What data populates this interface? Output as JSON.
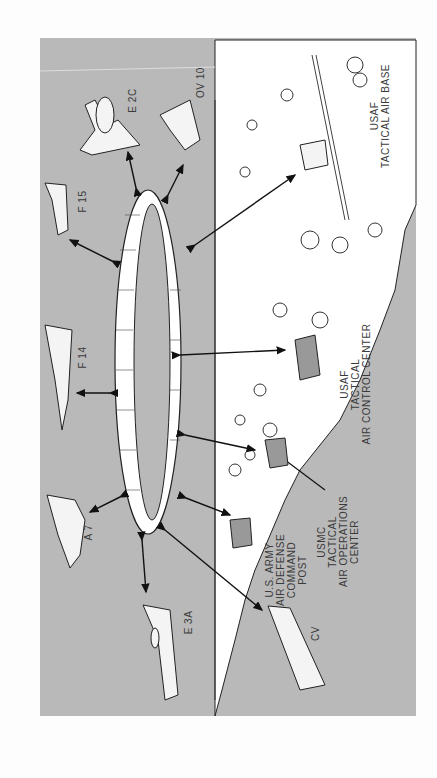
{
  "diagram": {
    "type": "communications network illustration",
    "orientation": "rotated 90 degrees",
    "colors": {
      "background": "#b9b9b9",
      "land": "#ffffff",
      "lines": "#1a1a1a",
      "page": "#fdfdfd"
    },
    "center_element": "ring (data link network)",
    "airborne_nodes": [
      {
        "id": "e3a",
        "label": "E 3A"
      },
      {
        "id": "a7",
        "label": "A 7"
      },
      {
        "id": "f14",
        "label": "F 14"
      },
      {
        "id": "f15",
        "label": "F 15"
      },
      {
        "id": "e2c",
        "label": "E 2C"
      },
      {
        "id": "ov10",
        "label": "OV 10"
      }
    ],
    "ground_nodes": [
      {
        "id": "cv",
        "label": "CV"
      },
      {
        "id": "army",
        "label": "U.S. ARMY\nAIR DEFENSE\nCOMMAND\nPOST"
      },
      {
        "id": "usmc",
        "label": "USMC\nTACTICAL\nAIR OPERATIONS\nCENTER"
      },
      {
        "id": "usaf_tacc",
        "label": "USAF\nTACTICAL\nAIR CONTROL CENTER"
      },
      {
        "id": "usaf_tab",
        "label": "USAF\nTACTICAL AIR BASE"
      }
    ]
  }
}
